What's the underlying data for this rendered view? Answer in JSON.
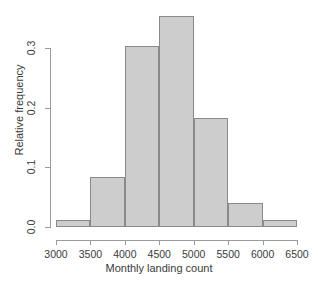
{
  "chart_data": {
    "type": "bar",
    "title": "",
    "subtitle": "",
    "xlabel": "Monthly landing count",
    "ylabel": "Relative frequency",
    "xlim": [
      3000,
      6500
    ],
    "ylim": [
      0.0,
      0.3667
    ],
    "grid": false,
    "legend": null,
    "bin_width": 500,
    "categories": [
      "3000-3500",
      "3500-4000",
      "4000-4500",
      "4500-5000",
      "5000-5500",
      "5500-6000",
      "6000-6500"
    ],
    "bin_edges": [
      3000,
      3500,
      4000,
      4500,
      5000,
      5500,
      6000,
      6500
    ],
    "values": [
      0.012,
      0.084,
      0.304,
      0.354,
      0.183,
      0.04,
      0.012
    ],
    "xticks": [
      "3000",
      "3500",
      "4000",
      "4500",
      "5000",
      "5500",
      "6000",
      "6500"
    ],
    "xtick_values": [
      3000,
      3500,
      4000,
      4500,
      5000,
      5500,
      6000,
      6500
    ],
    "yticks": [
      "0.0",
      "0.1",
      "0.2",
      "0.3"
    ],
    "ytick_values": [
      0.0,
      0.1,
      0.2,
      0.3
    ],
    "bar_fill_color": "#cdcdcd",
    "bar_border_color": "#8a8a8a",
    "axis_color": "#9a9a9a",
    "text_color": "#3a3a3a",
    "background_color": "#ffffff"
  }
}
